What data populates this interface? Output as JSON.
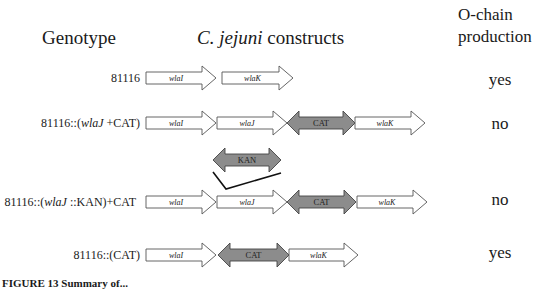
{
  "headers": {
    "genotype": "Genotype",
    "constructs_italic": "C. jejuni",
    "constructs_rest": " constructs",
    "ochain_line1": "O-chain",
    "ochain_line2": "production"
  },
  "colors": {
    "gene_fill": "#ffffff",
    "gene_stroke": "#555555",
    "marker_fill": "#8c8c8c",
    "marker_stroke": "#444444",
    "insertion_line": "#111111"
  },
  "rows": [
    {
      "genotype_parts": [
        "81116",
        "",
        ""
      ],
      "result": "yes",
      "elements": [
        {
          "type": "gene",
          "label": "wlaI",
          "x1": 146,
          "x2": 216
        },
        {
          "type": "gene",
          "label": "wlaK",
          "x1": 222,
          "x2": 293
        }
      ]
    },
    {
      "genotype_parts": [
        "81116::(",
        "wlaJ",
        " +CAT)"
      ],
      "result": "no",
      "elements": [
        {
          "type": "gene",
          "label": "wlaI",
          "x1": 146,
          "x2": 216
        },
        {
          "type": "gene",
          "label": "wlaJ",
          "x1": 217,
          "x2": 287
        },
        {
          "type": "marker",
          "label": "CAT",
          "x1": 287,
          "x2": 355
        },
        {
          "type": "gene",
          "label": "wlaK",
          "x1": 355,
          "x2": 425
        }
      ]
    },
    {
      "genotype_parts": [
        "81116::(",
        "wlaJ",
        " ::KAN)+CAT"
      ],
      "result": "no",
      "insertion": {
        "label": "KAN",
        "x1": 213,
        "x2": 281
      },
      "elements": [
        {
          "type": "gene",
          "label": "wlaI",
          "x1": 146,
          "x2": 216
        },
        {
          "type": "gene",
          "label": "wlaJ",
          "x1": 217,
          "x2": 287
        },
        {
          "type": "marker",
          "label": "CAT",
          "x1": 287,
          "x2": 356
        },
        {
          "type": "gene",
          "label": "wlaK",
          "x1": 357,
          "x2": 427
        }
      ]
    },
    {
      "genotype_parts": [
        "81116::(CAT)",
        "",
        ""
      ],
      "result": "yes",
      "elements": [
        {
          "type": "gene",
          "label": "wlaI",
          "x1": 146,
          "x2": 216
        },
        {
          "type": "marker",
          "label": "CAT",
          "x1": 218,
          "x2": 289
        },
        {
          "type": "gene",
          "label": "wlaK",
          "x1": 289,
          "x2": 358
        }
      ]
    }
  ],
  "caption": "FIGURE 13  Summary of..."
}
